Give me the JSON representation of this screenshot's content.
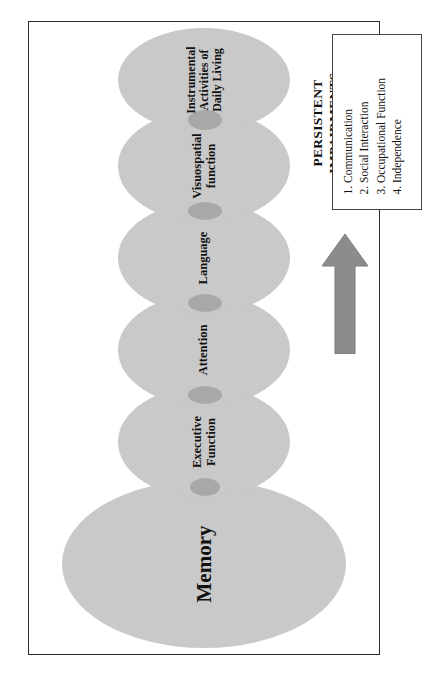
{
  "figure": {
    "orientation": "rotated-90-ccw",
    "frame_border_color": "#2b2b2b",
    "background_color": "#ffffff",
    "node_fill_color": "#c9c9c9",
    "node_overlap_color": "#a8a8a8",
    "arrow_color": "#8c8c8c",
    "arrow_icon": "right-block-arrow-icon",
    "nodes": [
      {
        "id": "memory",
        "label": "Memory"
      },
      {
        "id": "executive",
        "label": "Executive\nFunction"
      },
      {
        "id": "attention",
        "label": "Attention"
      },
      {
        "id": "language",
        "label": "Language"
      },
      {
        "id": "visuospatial",
        "label": "Visuospatial\nfunction"
      },
      {
        "id": "iadl",
        "label": "Instrumental\nActivities of\nDaily Living"
      }
    ],
    "outcome": {
      "caption_word_1": "PERSISTENT",
      "caption_word_2": "IMPAIRMENTS",
      "items": [
        "Communication",
        "Social Interaction",
        "Occupational Function",
        "Independence"
      ]
    }
  }
}
